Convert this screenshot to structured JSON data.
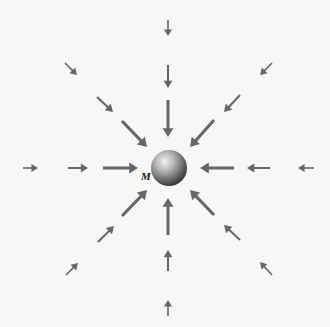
{
  "diagram": {
    "mass": {
      "label": "M",
      "cx": 169,
      "cy": 168,
      "r": 18
    },
    "arrow_color": "#666666",
    "arrows": [
      {
        "name": "n-far",
        "x1": 168,
        "y1": 20,
        "x2": 168,
        "y2": 36,
        "w": 1.6
      },
      {
        "name": "n-mid",
        "x1": 168,
        "y1": 65,
        "x2": 168,
        "y2": 88,
        "w": 2.0
      },
      {
        "name": "n-near",
        "x1": 168,
        "y1": 100,
        "x2": 168,
        "y2": 137,
        "w": 3.0
      },
      {
        "name": "s-near",
        "x1": 168,
        "y1": 235,
        "x2": 168,
        "y2": 198,
        "w": 3.0
      },
      {
        "name": "s-mid",
        "x1": 168,
        "y1": 271,
        "x2": 168,
        "y2": 250,
        "w": 2.0
      },
      {
        "name": "s-far",
        "x1": 168,
        "y1": 316,
        "x2": 168,
        "y2": 300,
        "w": 1.6
      },
      {
        "name": "w-far",
        "x1": 23,
        "y1": 168,
        "x2": 38,
        "y2": 168,
        "w": 1.6
      },
      {
        "name": "w-mid",
        "x1": 68,
        "y1": 168,
        "x2": 88,
        "y2": 168,
        "w": 2.0
      },
      {
        "name": "w-near",
        "x1": 103,
        "y1": 168,
        "x2": 138,
        "y2": 168,
        "w": 3.0
      },
      {
        "name": "e-near",
        "x1": 234,
        "y1": 168,
        "x2": 200,
        "y2": 168,
        "w": 3.0
      },
      {
        "name": "e-mid",
        "x1": 270,
        "y1": 168,
        "x2": 247,
        "y2": 168,
        "w": 2.0
      },
      {
        "name": "e-far",
        "x1": 314,
        "y1": 168,
        "x2": 298,
        "y2": 168,
        "w": 1.6
      },
      {
        "name": "nw-far",
        "x1": 65,
        "y1": 63,
        "x2": 77,
        "y2": 75,
        "w": 1.6
      },
      {
        "name": "nw-mid",
        "x1": 97,
        "y1": 97,
        "x2": 113,
        "y2": 112,
        "w": 2.0
      },
      {
        "name": "nw-near",
        "x1": 122,
        "y1": 121,
        "x2": 147,
        "y2": 147,
        "w": 3.0
      },
      {
        "name": "ne-far",
        "x1": 272,
        "y1": 63,
        "x2": 260,
        "y2": 75,
        "w": 1.6
      },
      {
        "name": "ne-mid",
        "x1": 240,
        "y1": 95,
        "x2": 224,
        "y2": 112,
        "w": 2.0
      },
      {
        "name": "ne-near",
        "x1": 214,
        "y1": 120,
        "x2": 190,
        "y2": 147,
        "w": 3.0
      },
      {
        "name": "sw-near",
        "x1": 122,
        "y1": 216,
        "x2": 147,
        "y2": 190,
        "w": 3.0
      },
      {
        "name": "sw-mid",
        "x1": 98,
        "y1": 242,
        "x2": 114,
        "y2": 226,
        "w": 2.0
      },
      {
        "name": "sw-far",
        "x1": 66,
        "y1": 275,
        "x2": 78,
        "y2": 263,
        "w": 1.6
      },
      {
        "name": "se-near",
        "x1": 214,
        "y1": 215,
        "x2": 190,
        "y2": 190,
        "w": 3.0
      },
      {
        "name": "se-mid",
        "x1": 240,
        "y1": 240,
        "x2": 224,
        "y2": 225,
        "w": 2.0
      },
      {
        "name": "se-far",
        "x1": 272,
        "y1": 275,
        "x2": 260,
        "y2": 262,
        "w": 1.6
      }
    ]
  }
}
